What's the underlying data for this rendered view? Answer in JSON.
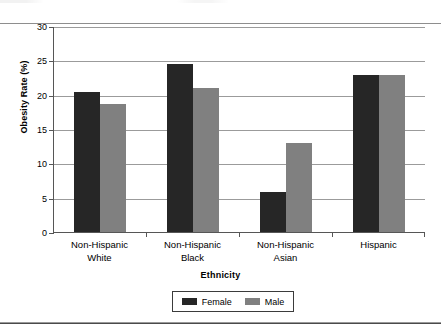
{
  "chart_data": {
    "type": "bar",
    "title": "",
    "xlabel": "Ethnicity",
    "ylabel": "Obesity Rate (%)",
    "categories": [
      "Non-Hispanic\nWhite",
      "Non-Hispanic\nBlack",
      "Non-Hispanic\nAsian",
      "Hispanic"
    ],
    "category_lines": [
      [
        "Non-Hispanic",
        "White"
      ],
      [
        "Non-Hispanic",
        "Black"
      ],
      [
        "Non-Hispanic",
        "Asian"
      ],
      [
        "Hispanic",
        ""
      ]
    ],
    "series": [
      {
        "name": "Female",
        "color": "#262626",
        "values": [
          20.4,
          24.4,
          5.8,
          22.9
        ]
      },
      {
        "name": "Male",
        "color": "#808080",
        "values": [
          18.7,
          20.9,
          13.0,
          22.9
        ]
      }
    ],
    "ylim": [
      0,
      30
    ],
    "ytick_values": [
      0,
      5,
      10,
      15,
      20,
      25,
      30
    ],
    "ytick_labels": [
      "0",
      "5",
      "10",
      "15",
      "20",
      "25",
      "30"
    ],
    "grid": true,
    "grid_axis": "y",
    "legend_position": "bottom-center",
    "legend_entries": [
      "Female",
      "Male"
    ]
  },
  "colors": {
    "female_bar": "#262626",
    "male_bar": "#808080",
    "gridline": "#9b9b9b",
    "axis": "#565656",
    "background": "#ffffff"
  }
}
